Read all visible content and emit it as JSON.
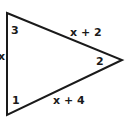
{
  "diagram": {
    "type": "triangle",
    "stroke_color": "#1a1a1a",
    "background": "#ffffff",
    "vertices": {
      "top_left": [
        7,
        13
      ],
      "bottom_left": [
        7,
        115
      ],
      "right": [
        122,
        60
      ]
    },
    "angles": [
      {
        "id": "angle-3",
        "label": "3",
        "position": "top-left"
      },
      {
        "id": "angle-2",
        "label": "2",
        "position": "right"
      },
      {
        "id": "angle-1",
        "label": "1",
        "position": "bottom-left"
      }
    ],
    "sides": [
      {
        "id": "side-left",
        "label": "x",
        "between": [
          "top_left",
          "bottom_left"
        ]
      },
      {
        "id": "side-top",
        "label": "x + 2",
        "between": [
          "top_left",
          "right"
        ]
      },
      {
        "id": "side-bottom",
        "label": "x + 4",
        "between": [
          "bottom_left",
          "right"
        ]
      }
    ]
  },
  "labels": {
    "angle_3": "3",
    "angle_2": "2",
    "angle_1": "1",
    "side_left": "x",
    "side_top": "x + 2",
    "side_bottom": "x + 4"
  }
}
